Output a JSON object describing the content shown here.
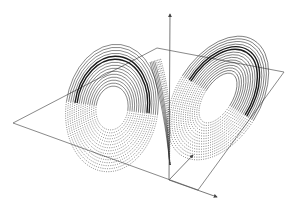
{
  "figure": {
    "title": "Lorenz attractor",
    "background": "#ffffff",
    "stroke_color": "#1a1a1a",
    "axis_color": "#555555",
    "plane_color": "#6b6b6b"
  },
  "axes": {
    "origin": [
      169,
      180
    ],
    "z_axis": {
      "label": "",
      "tip": [
        170,
        14
      ]
    },
    "x_axis": {
      "label": "",
      "tip": [
        217,
        197
      ]
    },
    "y_axis": {
      "label": "",
      "tip": [
        193,
        155
      ]
    }
  },
  "plane": {
    "corners": [
      [
        13,
        123
      ],
      [
        157,
        48
      ],
      [
        284,
        72
      ],
      [
        198,
        190
      ]
    ]
  },
  "lobes": {
    "left": {
      "center": [
        112,
        108
      ],
      "rx_min": 16,
      "rx_max": 46,
      "ry_min": 22,
      "ry_max": 64,
      "rotation": 8,
      "rings": 15
    },
    "right": {
      "center": [
        218,
        98
      ],
      "rx_min": 14,
      "rx_max": 42,
      "ry_min": 28,
      "ry_max": 68,
      "rotation": 32,
      "rings": 15
    }
  }
}
